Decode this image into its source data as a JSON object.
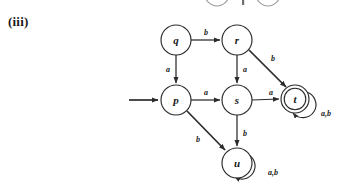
{
  "figure": {
    "label": "(iii)",
    "type": "finite-state-automaton",
    "alphabet": [
      "a",
      "b"
    ],
    "start_state": "p",
    "accepting_states": [
      "t"
    ]
  },
  "states": [
    {
      "id": "q",
      "label": "q",
      "cx": 176,
      "cy": 40,
      "r": 15,
      "accepting": false
    },
    {
      "id": "r",
      "label": "r",
      "cx": 237,
      "cy": 40,
      "r": 15,
      "accepting": false
    },
    {
      "id": "p",
      "label": "p",
      "cx": 176,
      "cy": 100,
      "r": 15,
      "accepting": false
    },
    {
      "id": "s",
      "label": "s",
      "cx": 237,
      "cy": 100,
      "r": 15,
      "accepting": false
    },
    {
      "id": "t",
      "label": "t",
      "cx": 295,
      "cy": 99,
      "r": 14,
      "accepting": true
    },
    {
      "id": "u",
      "label": "u",
      "cx": 237,
      "cy": 163,
      "r": 15,
      "accepting": false
    }
  ],
  "transitions": [
    {
      "from": "q",
      "to": "r",
      "symbol": "b",
      "label_x": 206,
      "label_y": 32
    },
    {
      "from": "q",
      "to": "p",
      "symbol": "a",
      "label_x": 168,
      "label_y": 69
    },
    {
      "from": "r",
      "to": "s",
      "symbol": "a",
      "label_x": 245,
      "label_y": 69
    },
    {
      "from": "r",
      "to": "t",
      "symbol": "b",
      "label_x": 273,
      "label_y": 58
    },
    {
      "from": "p",
      "to": "s",
      "symbol": "a",
      "label_x": 206,
      "label_y": 92
    },
    {
      "from": "p",
      "to": "u",
      "symbol": "b",
      "label_x": 198,
      "label_y": 139
    },
    {
      "from": "s",
      "to": "t",
      "symbol": "a",
      "label_x": 271,
      "label_y": 92
    },
    {
      "from": "s",
      "to": "u",
      "symbol": "b",
      "label_x": 245,
      "label_y": 133
    },
    {
      "from": "t",
      "to": "t",
      "symbol": "a,b",
      "label_x": 326,
      "label_y": 113,
      "self_loop": true
    },
    {
      "from": "u",
      "to": "u",
      "symbol": "a,b",
      "label_x": 273,
      "label_y": 172,
      "self_loop": true
    }
  ],
  "start_arrow": {
    "name": "start-arrow",
    "from_x": 129,
    "to_x": 160,
    "y": 100
  },
  "colors": {
    "ink": "#2b2b2b",
    "text": "#1a1a1a",
    "background": "#ffffff",
    "ghost": "#9a9a9a"
  }
}
